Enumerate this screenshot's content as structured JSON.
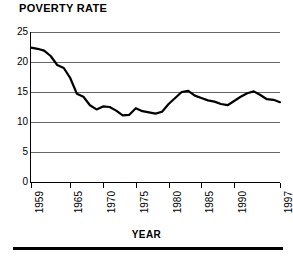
{
  "chart_data": {
    "type": "line",
    "title": "POVERTY RATE",
    "subtitle": "",
    "xlabel": "YEAR",
    "ylabel": "",
    "xlim": [
      1959,
      1997
    ],
    "ylim": [
      0,
      25
    ],
    "grid": true,
    "legend": "none",
    "y_ticks": [
      25,
      20,
      15,
      10,
      5,
      0
    ],
    "y_tick_labels": [
      "25",
      "20",
      "15",
      "10",
      "5",
      "0"
    ],
    "x_ticks": [
      1959,
      1965,
      1970,
      1975,
      1980,
      1985,
      1990,
      1997
    ],
    "x_tick_labels": [
      "1959",
      "1965",
      "1970",
      "1975",
      "1980",
      "1985",
      "1990",
      "1997"
    ],
    "series_name": "Poverty rate",
    "line_color": "#000000",
    "grid_color": "#666666",
    "x": [
      1959,
      1960,
      1961,
      1962,
      1963,
      1964,
      1965,
      1966,
      1967,
      1968,
      1969,
      1970,
      1971,
      1972,
      1973,
      1974,
      1975,
      1976,
      1977,
      1978,
      1979,
      1980,
      1981,
      1982,
      1983,
      1984,
      1985,
      1986,
      1987,
      1988,
      1989,
      1990,
      1991,
      1992,
      1993,
      1994,
      1995,
      1996,
      1997
    ],
    "values": [
      22.4,
      22.2,
      21.9,
      21.0,
      19.5,
      19.0,
      17.3,
      14.7,
      14.2,
      12.8,
      12.1,
      12.6,
      12.5,
      11.9,
      11.1,
      11.2,
      12.3,
      11.8,
      11.6,
      11.4,
      11.7,
      13.0,
      14.0,
      15.0,
      15.2,
      14.4,
      14.0,
      13.6,
      13.4,
      13.0,
      12.8,
      13.5,
      14.2,
      14.8,
      15.1,
      14.5,
      13.8,
      13.7,
      13.3
    ]
  },
  "meta": {
    "title_text": "POVERTY RATE",
    "axis_title_text": "YEAR"
  }
}
